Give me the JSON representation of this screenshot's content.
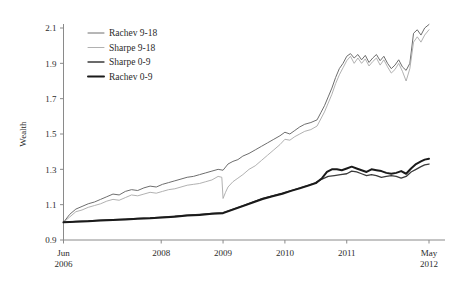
{
  "chart_data": {
    "type": "line",
    "title": "",
    "xlabel": "",
    "ylabel": "Wealth",
    "ylim": [
      0.9,
      2.1
    ],
    "yticks": [
      0.9,
      1.1,
      1.3,
      1.5,
      1.7,
      1.9,
      2.1
    ],
    "ytick_labels": [
      "0.9",
      "1.1",
      "1.3",
      "1.5",
      "1.7",
      "1.9",
      "2.1"
    ],
    "xlim": [
      2006.42,
      2012.33
    ],
    "xticks": [
      2006.42,
      2008.0,
      2009.0,
      2010.0,
      2011.0,
      2012.33
    ],
    "xtick_labels": [
      "Jun\n2006",
      "2008",
      "2009",
      "2010",
      "2011",
      "May\n2012"
    ],
    "xtick_labels_multiline": [
      {
        "line1": "Jun",
        "line2": "2006"
      },
      {
        "line1": "2008",
        "line2": ""
      },
      {
        "line1": "2009",
        "line2": ""
      },
      {
        "line1": "2010",
        "line2": ""
      },
      {
        "line1": "2011",
        "line2": ""
      },
      {
        "line1": "May",
        "line2": "2012"
      }
    ],
    "grid": false,
    "legend_position": "upper left",
    "series": [
      {
        "name": "Rachev 9-18",
        "color": "#6e6e6e",
        "width": 1.0,
        "x": [
          2006.42,
          2006.52,
          2006.62,
          2006.72,
          2006.82,
          2006.92,
          2007.02,
          2007.12,
          2007.22,
          2007.32,
          2007.42,
          2007.52,
          2007.62,
          2007.72,
          2007.82,
          2007.92,
          2008.02,
          2008.12,
          2008.22,
          2008.32,
          2008.42,
          2008.52,
          2008.62,
          2008.72,
          2008.82,
          2008.92,
          2009.0,
          2009.08,
          2009.16,
          2009.24,
          2009.32,
          2009.42,
          2009.52,
          2009.62,
          2009.72,
          2009.82,
          2009.92,
          2010.0,
          2010.08,
          2010.16,
          2010.24,
          2010.32,
          2010.42,
          2010.52,
          2010.58,
          2010.64,
          2010.7,
          2010.76,
          2010.82,
          2010.88,
          2010.94,
          2011.0,
          2011.06,
          2011.12,
          2011.18,
          2011.24,
          2011.3,
          2011.36,
          2011.42,
          2011.48,
          2011.54,
          2011.6,
          2011.66,
          2011.72,
          2011.78,
          2011.84,
          2011.9,
          2011.96,
          2012.02,
          2012.08,
          2012.14,
          2012.2,
          2012.26,
          2012.33
        ],
        "y": [
          1.0,
          1.045,
          1.075,
          1.09,
          1.105,
          1.115,
          1.13,
          1.145,
          1.16,
          1.155,
          1.175,
          1.185,
          1.18,
          1.195,
          1.205,
          1.2,
          1.215,
          1.225,
          1.235,
          1.245,
          1.255,
          1.26,
          1.27,
          1.28,
          1.29,
          1.3,
          1.295,
          1.33,
          1.345,
          1.355,
          1.375,
          1.39,
          1.41,
          1.43,
          1.45,
          1.47,
          1.49,
          1.51,
          1.5,
          1.52,
          1.54,
          1.555,
          1.565,
          1.58,
          1.62,
          1.66,
          1.71,
          1.76,
          1.82,
          1.87,
          1.9,
          1.94,
          1.955,
          1.93,
          1.95,
          1.92,
          1.945,
          1.905,
          1.93,
          1.95,
          1.915,
          1.94,
          1.9,
          1.87,
          1.89,
          1.92,
          1.88,
          1.86,
          1.9,
          2.07,
          2.09,
          2.06,
          2.1,
          2.12
        ]
      },
      {
        "name": "Sharpe 9-18",
        "color": "#a8a8a8",
        "width": 0.9,
        "x": [
          2006.42,
          2006.52,
          2006.62,
          2006.72,
          2006.82,
          2006.92,
          2007.02,
          2007.12,
          2007.22,
          2007.32,
          2007.42,
          2007.52,
          2007.62,
          2007.72,
          2007.82,
          2007.92,
          2008.02,
          2008.12,
          2008.22,
          2008.32,
          2008.42,
          2008.52,
          2008.62,
          2008.72,
          2008.82,
          2008.92,
          2008.98,
          2009.0,
          2009.04,
          2009.08,
          2009.16,
          2009.24,
          2009.32,
          2009.42,
          2009.52,
          2009.62,
          2009.72,
          2009.82,
          2009.92,
          2010.0,
          2010.08,
          2010.16,
          2010.24,
          2010.32,
          2010.42,
          2010.52,
          2010.58,
          2010.64,
          2010.7,
          2010.76,
          2010.82,
          2010.88,
          2010.94,
          2011.0,
          2011.06,
          2011.12,
          2011.18,
          2011.24,
          2011.3,
          2011.36,
          2011.42,
          2011.48,
          2011.54,
          2011.6,
          2011.66,
          2011.72,
          2011.78,
          2011.84,
          2011.9,
          2011.96,
          2012.02,
          2012.08,
          2012.14,
          2012.2,
          2012.26,
          2012.33
        ],
        "y": [
          1.0,
          1.03,
          1.06,
          1.07,
          1.085,
          1.095,
          1.105,
          1.12,
          1.13,
          1.125,
          1.14,
          1.155,
          1.15,
          1.16,
          1.17,
          1.165,
          1.175,
          1.185,
          1.19,
          1.2,
          1.21,
          1.215,
          1.22,
          1.23,
          1.24,
          1.26,
          1.255,
          1.135,
          1.17,
          1.2,
          1.23,
          1.25,
          1.27,
          1.3,
          1.32,
          1.35,
          1.38,
          1.41,
          1.44,
          1.47,
          1.465,
          1.485,
          1.5,
          1.515,
          1.525,
          1.545,
          1.585,
          1.625,
          1.675,
          1.725,
          1.785,
          1.835,
          1.875,
          1.915,
          1.94,
          1.9,
          1.93,
          1.9,
          1.925,
          1.885,
          1.91,
          1.93,
          1.89,
          1.92,
          1.88,
          1.845,
          1.865,
          1.9,
          1.855,
          1.8,
          1.87,
          2.02,
          2.05,
          2.02,
          2.06,
          2.09
        ]
      },
      {
        "name": "Sharpe 0-9",
        "color": "#3b3b3b",
        "width": 1.3,
        "x": [
          2006.42,
          2006.62,
          2006.82,
          2007.02,
          2007.22,
          2007.42,
          2007.62,
          2007.82,
          2008.02,
          2008.22,
          2008.42,
          2008.62,
          2008.82,
          2009.0,
          2009.16,
          2009.32,
          2009.48,
          2009.64,
          2009.8,
          2009.96,
          2010.1,
          2010.24,
          2010.38,
          2010.5,
          2010.6,
          2010.7,
          2010.8,
          2010.9,
          2011.0,
          2011.08,
          2011.16,
          2011.24,
          2011.32,
          2011.4,
          2011.48,
          2011.56,
          2011.64,
          2011.72,
          2011.8,
          2011.88,
          2011.96,
          2012.04,
          2012.12,
          2012.2,
          2012.26,
          2012.33
        ],
        "y": [
          1.0,
          1.005,
          1.008,
          1.012,
          1.015,
          1.018,
          1.022,
          1.025,
          1.03,
          1.035,
          1.04,
          1.045,
          1.05,
          1.055,
          1.075,
          1.095,
          1.115,
          1.135,
          1.15,
          1.165,
          1.18,
          1.195,
          1.21,
          1.225,
          1.245,
          1.26,
          1.265,
          1.27,
          1.275,
          1.29,
          1.285,
          1.275,
          1.265,
          1.27,
          1.265,
          1.255,
          1.26,
          1.265,
          1.26,
          1.25,
          1.26,
          1.285,
          1.3,
          1.315,
          1.325,
          1.33
        ]
      },
      {
        "name": "Rachev 0-9",
        "color": "#1a1a1a",
        "width": 2.0,
        "x": [
          2006.42,
          2006.62,
          2006.82,
          2007.02,
          2007.22,
          2007.42,
          2007.62,
          2007.82,
          2008.02,
          2008.22,
          2008.42,
          2008.62,
          2008.82,
          2009.0,
          2009.16,
          2009.32,
          2009.48,
          2009.64,
          2009.8,
          2009.96,
          2010.1,
          2010.24,
          2010.38,
          2010.5,
          2010.6,
          2010.68,
          2010.76,
          2010.84,
          2010.92,
          2011.0,
          2011.08,
          2011.16,
          2011.24,
          2011.32,
          2011.4,
          2011.48,
          2011.56,
          2011.64,
          2011.72,
          2011.8,
          2011.88,
          2011.96,
          2012.04,
          2012.12,
          2012.2,
          2012.26,
          2012.33
        ],
        "y": [
          1.0,
          1.004,
          1.006,
          1.01,
          1.013,
          1.016,
          1.02,
          1.023,
          1.028,
          1.032,
          1.038,
          1.042,
          1.048,
          1.052,
          1.072,
          1.092,
          1.112,
          1.132,
          1.148,
          1.162,
          1.178,
          1.192,
          1.208,
          1.222,
          1.25,
          1.285,
          1.3,
          1.3,
          1.295,
          1.305,
          1.315,
          1.305,
          1.295,
          1.285,
          1.3,
          1.295,
          1.29,
          1.28,
          1.275,
          1.28,
          1.29,
          1.275,
          1.305,
          1.33,
          1.345,
          1.355,
          1.36
        ]
      }
    ]
  },
  "legend": {
    "items": [
      {
        "label": "Rachev 9-18"
      },
      {
        "label": "Sharpe 9-18"
      },
      {
        "label": "Sharpe 0-9"
      },
      {
        "label": "Rachev 0-9"
      }
    ]
  },
  "axes": {
    "y_title": "Wealth"
  }
}
